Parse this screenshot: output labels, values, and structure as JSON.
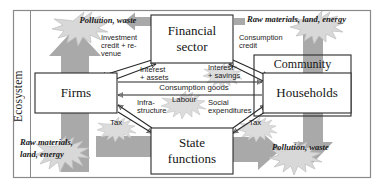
{
  "diagram": {
    "frame_label": "Ecosystem",
    "colors": {
      "gray_arrow": "#a9a9a9",
      "starburst_fill": "#d8d8d8",
      "starburst_stroke": "#b5b5b5",
      "box_stroke": "#2b2b2b",
      "frame_stroke": "#8a8a8a",
      "text": "#1a1a1a",
      "background": "#ffffff"
    },
    "nodes": [
      {
        "id": "financial-sector",
        "label": "Financial\nsector",
        "line1": "Financial",
        "line2": "sector",
        "x": 151,
        "y": 15,
        "w": 82,
        "h": 48
      },
      {
        "id": "firms",
        "label": "Firms",
        "line1": "Firms",
        "line2": "",
        "x": 35,
        "y": 73,
        "w": 82,
        "h": 40
      },
      {
        "id": "community",
        "label": "Community",
        "line1": "Community",
        "line2": "",
        "x": 254,
        "y": 55,
        "w": 97,
        "h": 61
      },
      {
        "id": "households",
        "label": "Households",
        "line1": "Households",
        "line2": "",
        "x": 263,
        "y": 73,
        "w": 88,
        "h": 40
      },
      {
        "id": "state-functions",
        "label": "State\nfunctions",
        "line1": "State",
        "line2": "functions",
        "x": 151,
        "y": 128,
        "w": 82,
        "h": 46
      }
    ],
    "flow_labels": [
      {
        "id": "investment-credit-revenue",
        "lines": [
          "Investment",
          "credit + re-",
          "venue"
        ],
        "x": 101,
        "y": 37
      },
      {
        "id": "consumption-credit",
        "lines": [
          "Consumption",
          "credit"
        ],
        "x": 240,
        "y": 37
      },
      {
        "id": "interest-assets",
        "lines": [
          "Interest",
          "+ assets"
        ],
        "x": 141,
        "y": 68
      },
      {
        "id": "interest-savings",
        "lines": [
          "Interest",
          "+ savings"
        ],
        "x": 209,
        "y": 66
      },
      {
        "id": "consumption-goods",
        "lines": [
          "Consumption goods"
        ],
        "x": 148,
        "y": 87
      },
      {
        "id": "infrastructure",
        "lines": [
          "Infra-",
          "structure"
        ],
        "x": 140,
        "y": 102
      },
      {
        "id": "labour",
        "lines": [
          "Labour"
        ],
        "x": 172,
        "y": 99
      },
      {
        "id": "social-expenditures",
        "lines": [
          "Social",
          "expenditures"
        ],
        "x": 208,
        "y": 102
      },
      {
        "id": "tax-left",
        "lines": [
          "Tax"
        ],
        "x": 108,
        "y": 122
      },
      {
        "id": "tax-right",
        "lines": [
          "Tax"
        ],
        "x": 247,
        "y": 122
      }
    ],
    "ecosystem_flows": [
      {
        "id": "pollution-waste-top-left",
        "text": "Pollution, waste",
        "x": 62,
        "y": 21,
        "w": 86,
        "align": "center"
      },
      {
        "id": "raw-materials-top-right",
        "text": "Raw materials, land, energy",
        "x": 243,
        "y": 20,
        "w": 131,
        "align": "left"
      },
      {
        "id": "raw-materials-bottom-left",
        "text": "Raw materials,|land, energy",
        "x": 20,
        "y": 137,
        "w": 80,
        "align": "left"
      },
      {
        "id": "pollution-waste-bottom-right",
        "text": "Pollution, waste",
        "x": 272,
        "y": 144,
        "w": 86,
        "align": "left"
      }
    ]
  }
}
